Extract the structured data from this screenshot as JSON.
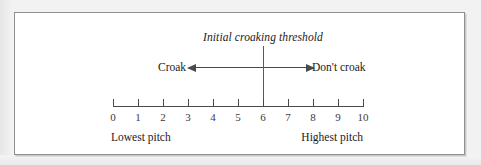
{
  "figure": {
    "title": "Initial croaking threshold",
    "threshold_value": 6,
    "left_region_label": "Croak",
    "right_region_label": "Don't croak",
    "low_end_caption": "Lowest pitch",
    "high_end_caption": "Highest pitch",
    "frame_color": "#8d8f92",
    "line_color": "#4a4a4a",
    "background_color": "#ffffff"
  },
  "chart_data": {
    "type": "line",
    "title": "Initial croaking threshold",
    "xlabel": "",
    "ylabel": "",
    "xlim": [
      0,
      10
    ],
    "grid": false,
    "legend": "none",
    "categories": [
      "0",
      "1",
      "2",
      "3",
      "4",
      "5",
      "6",
      "7",
      "8",
      "9",
      "10"
    ],
    "values": [
      0,
      1,
      2,
      3,
      4,
      5,
      6,
      7,
      8,
      9,
      10
    ],
    "tick_labels": [
      "0",
      "1",
      "2",
      "3",
      "4",
      "5",
      "6",
      "7",
      "8",
      "9",
      "10"
    ],
    "annotations": [
      {
        "text": "Initial croaking threshold",
        "x": 6,
        "kind": "threshold-label"
      },
      {
        "text": "Croak",
        "x_range": [
          0,
          6
        ],
        "kind": "region-left",
        "arrow": "left"
      },
      {
        "text": "Don't croak",
        "x_range": [
          6,
          10
        ],
        "kind": "region-right",
        "arrow": "right"
      },
      {
        "text": "Lowest pitch",
        "x": 0,
        "kind": "axis-endpoint"
      },
      {
        "text": "Highest pitch",
        "x": 10,
        "kind": "axis-endpoint"
      }
    ],
    "threshold": {
      "value": 6,
      "orientation": "vertical"
    }
  }
}
